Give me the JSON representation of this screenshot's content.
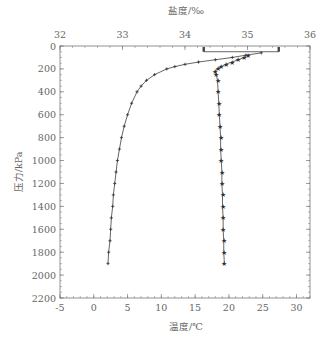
{
  "chart_data": {
    "type": "line",
    "title": "",
    "top_axis": {
      "label": "盐度/‰",
      "ticks": [
        32,
        33,
        34,
        35,
        36
      ],
      "range": [
        32,
        36
      ]
    },
    "bottom_axis": {
      "label": "温度/℃",
      "ticks": [
        -5,
        0,
        5,
        10,
        15,
        20,
        25,
        30
      ],
      "range": [
        -5,
        32
      ]
    },
    "left_axis": {
      "label": "压力/kPa",
      "ticks": [
        0,
        200,
        400,
        600,
        800,
        1000,
        1200,
        1400,
        1600,
        1800,
        2000,
        2200
      ],
      "range": [
        0,
        2200
      ],
      "inverted": true
    },
    "series": [
      {
        "name": "温度",
        "axis": "bottom",
        "marker": "plus",
        "points": [
          {
            "p": 60,
            "v": 24.8
          },
          {
            "p": 80,
            "v": 22.5
          },
          {
            "p": 100,
            "v": 20.5
          },
          {
            "p": 120,
            "v": 18.0
          },
          {
            "p": 140,
            "v": 15.5
          },
          {
            "p": 160,
            "v": 13.5
          },
          {
            "p": 180,
            "v": 12.0
          },
          {
            "p": 200,
            "v": 10.8
          },
          {
            "p": 250,
            "v": 9.0
          },
          {
            "p": 300,
            "v": 7.8
          },
          {
            "p": 350,
            "v": 7.0
          },
          {
            "p": 400,
            "v": 6.4
          },
          {
            "p": 500,
            "v": 5.6
          },
          {
            "p": 600,
            "v": 5.0
          },
          {
            "p": 700,
            "v": 4.5
          },
          {
            "p": 800,
            "v": 4.1
          },
          {
            "p": 900,
            "v": 3.8
          },
          {
            "p": 1000,
            "v": 3.5
          },
          {
            "p": 1100,
            "v": 3.3
          },
          {
            "p": 1200,
            "v": 3.1
          },
          {
            "p": 1300,
            "v": 2.9
          },
          {
            "p": 1400,
            "v": 2.8
          },
          {
            "p": 1500,
            "v": 2.6
          },
          {
            "p": 1600,
            "v": 2.5
          },
          {
            "p": 1700,
            "v": 2.4
          },
          {
            "p": 1800,
            "v": 2.2
          },
          {
            "p": 1900,
            "v": 2.1
          }
        ]
      },
      {
        "name": "盐度",
        "axis": "top",
        "marker": "star",
        "points": [
          {
            "p": 80,
            "v": 35.0
          },
          {
            "p": 100,
            "v": 34.95
          },
          {
            "p": 120,
            "v": 34.85
          },
          {
            "p": 140,
            "v": 34.75
          },
          {
            "p": 160,
            "v": 34.65
          },
          {
            "p": 180,
            "v": 34.58
          },
          {
            "p": 200,
            "v": 34.52
          },
          {
            "p": 220,
            "v": 34.48
          },
          {
            "p": 250,
            "v": 34.5
          },
          {
            "p": 300,
            "v": 34.52
          },
          {
            "p": 400,
            "v": 34.53
          },
          {
            "p": 500,
            "v": 34.54
          },
          {
            "p": 600,
            "v": 34.55
          },
          {
            "p": 700,
            "v": 34.56
          },
          {
            "p": 800,
            "v": 34.57
          },
          {
            "p": 900,
            "v": 34.57
          },
          {
            "p": 1000,
            "v": 34.58
          },
          {
            "p": 1100,
            "v": 34.59
          },
          {
            "p": 1200,
            "v": 34.59
          },
          {
            "p": 1300,
            "v": 34.6
          },
          {
            "p": 1400,
            "v": 34.6
          },
          {
            "p": 1500,
            "v": 34.61
          },
          {
            "p": 1600,
            "v": 34.61
          },
          {
            "p": 1700,
            "v": 34.62
          },
          {
            "p": 1800,
            "v": 34.62
          },
          {
            "p": 1900,
            "v": 34.63
          }
        ]
      }
    ],
    "annotations": [
      {
        "type": "bracket",
        "axis": "top",
        "p_from": 0,
        "p_to": 50,
        "v_from": 34.3,
        "v_to": 35.5
      }
    ],
    "grid": false,
    "legend": "none"
  }
}
